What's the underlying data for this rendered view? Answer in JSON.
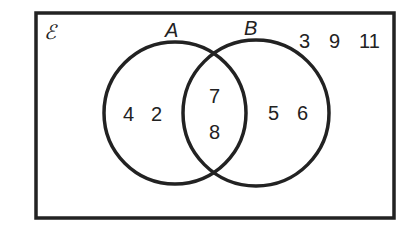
{
  "diagram": {
    "type": "venn",
    "universal_label": "ℰ",
    "sets": [
      {
        "name": "A",
        "label": "A"
      },
      {
        "name": "B",
        "label": "B"
      }
    ],
    "regions": {
      "a_only": [
        "4",
        "2"
      ],
      "intersection": [
        "7",
        "8"
      ],
      "b_only": [
        "5",
        "6"
      ],
      "outside": [
        "3",
        "9",
        "11"
      ]
    },
    "colors": {
      "stroke": "#222222",
      "background": "#ffffff"
    }
  }
}
